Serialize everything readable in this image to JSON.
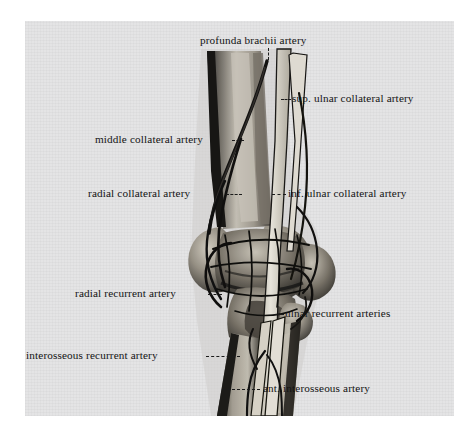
{
  "figure": {
    "domain": "anatomical-illustration",
    "view": "anterior view of right humerus, elbow joint and proximal forearm",
    "medium": "black-and-white halftone photographic plate on grey paper",
    "background_color": "#ececed",
    "page_color": "#ffffff",
    "ink_color": "#131313"
  },
  "labels": [
    {
      "id": "profunda-brachii-artery",
      "text": "profunda brachii artery",
      "side": "top"
    },
    {
      "id": "sup-ulnar-collateral-artery",
      "text": "sup. ulnar collateral artery",
      "side": "right"
    },
    {
      "id": "middle-collateral-artery",
      "text": "middle collateral artery",
      "side": "left"
    },
    {
      "id": "radial-collateral-artery",
      "text": "radial collateral artery",
      "side": "left"
    },
    {
      "id": "inf-ulnar-collateral-artery",
      "text": "inf. ulnar collateral artery",
      "side": "right"
    },
    {
      "id": "radial-recurrent-artery",
      "text": "radial recurrent artery",
      "side": "left"
    },
    {
      "id": "ulnar-recurrent-arteries",
      "text": "ulnar recurrent arteries",
      "side": "right"
    },
    {
      "id": "interosseous-recurrent-artery",
      "text": "interosseous recurrent artery",
      "side": "left"
    },
    {
      "id": "ant-interosseous-artery",
      "text": "ant. interosseous artery",
      "side": "right"
    }
  ],
  "structures": [
    {
      "id": "humerus-shaft",
      "name": "humerus (shaft)"
    },
    {
      "id": "lateral-epicondyle",
      "name": "lateral epicondyle"
    },
    {
      "id": "medial-epicondyle",
      "name": "medial epicondyle"
    },
    {
      "id": "capitulum-trochlea",
      "name": "capitulum and trochlea"
    },
    {
      "id": "radius",
      "name": "radius"
    },
    {
      "id": "ulna",
      "name": "ulna"
    },
    {
      "id": "brachial-artery",
      "name": "brachial artery"
    },
    {
      "id": "radial-artery",
      "name": "radial artery"
    },
    {
      "id": "ulnar-artery",
      "name": "ulnar artery"
    },
    {
      "id": "elbow-anastomosis",
      "name": "periarticular arterial anastomosis"
    }
  ]
}
